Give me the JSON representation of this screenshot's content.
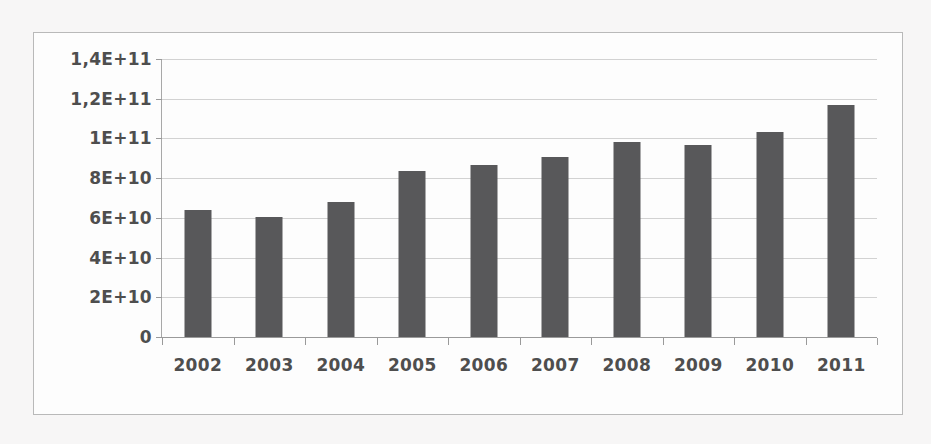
{
  "chart_data": {
    "type": "bar",
    "title": "",
    "subtitle": "",
    "xlabel": "",
    "ylabel": "",
    "categories": [
      "2002",
      "2003",
      "2004",
      "2005",
      "2006",
      "2007",
      "2008",
      "2009",
      "2010",
      "2011"
    ],
    "values": [
      64000000000,
      60500000000,
      68000000000,
      83500000000,
      86500000000,
      90500000000,
      98000000000,
      96500000000,
      103000000000,
      117000000000
    ],
    "ylim": [
      0,
      140000000000
    ],
    "ytick_values": [
      0,
      20000000000,
      40000000000,
      60000000000,
      80000000000,
      100000000000,
      120000000000,
      140000000000
    ],
    "ytick_labels": [
      "0",
      "2E+10",
      "4E+10",
      "6E+10",
      "8E+10",
      "1E+11",
      "1,2E+11",
      "1,4E+11"
    ],
    "grid": true,
    "legend": false,
    "legend_position": "none",
    "series": [
      {
        "name": "",
        "color": "#58585a",
        "values": [
          64000000000,
          60500000000,
          68000000000,
          83500000000,
          86500000000,
          90500000000,
          98000000000,
          96500000000,
          103000000000,
          117000000000
        ]
      }
    ],
    "annotations": []
  },
  "style": {
    "bar_color": "#58585a",
    "gridline_color": "#d2d2d2",
    "axis_color": "#9a9a9a",
    "frame_border_color": "#b9b9b9",
    "plot_background": "#fdfdfd",
    "page_background": "#f7f6f6",
    "tick_label_color": "#4e4e4e"
  }
}
